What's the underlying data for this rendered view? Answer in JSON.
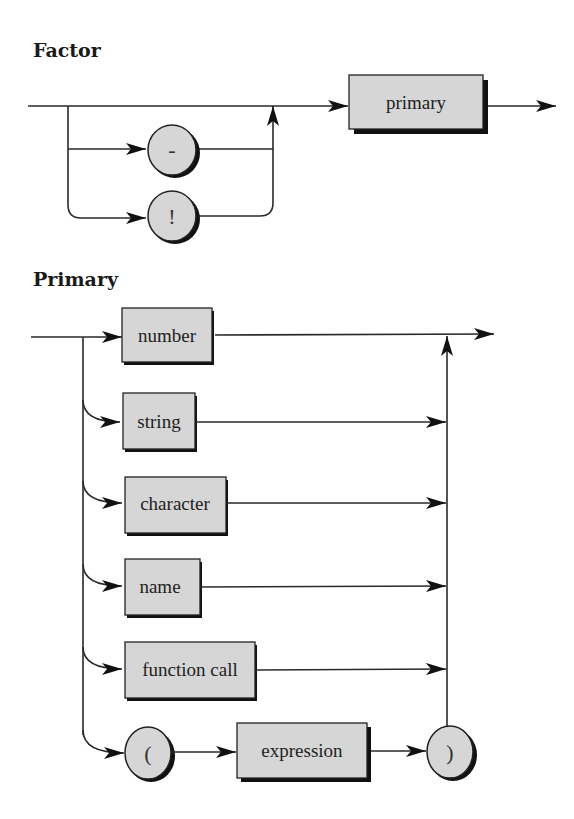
{
  "diagrams": [
    {
      "title": "Factor",
      "nonterminals": [
        "primary"
      ],
      "terminals": [
        "-",
        "!"
      ]
    },
    {
      "title": "Primary",
      "nonterminals": [
        "number",
        "string",
        "character",
        "name",
        "function call",
        "expression"
      ],
      "terminals": [
        "(",
        ")"
      ]
    }
  ],
  "factor": {
    "title": "Factor",
    "minus": "-",
    "bang": "!",
    "primary": "primary"
  },
  "primary": {
    "title": "Primary",
    "number": "number",
    "string": "string",
    "character": "character",
    "name": "name",
    "function_call": "function call",
    "lparen": "(",
    "expression": "expression",
    "rparen": ")"
  },
  "colors": {
    "box_fill": "#d6d6d6",
    "line": "#2a2a2a",
    "shadow": "#111111"
  }
}
